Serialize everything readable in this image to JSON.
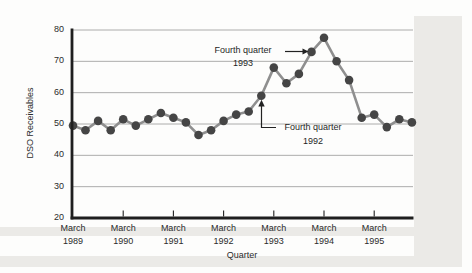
{
  "figure": {
    "y_axis_title": "DSO Receivables",
    "x_axis_title": "Quarter",
    "y_tick_labels": [
      "80",
      "70",
      "60",
      "50",
      "40",
      "30",
      "20"
    ],
    "x_ticks": [
      {
        "month": "March",
        "year": "1989"
      },
      {
        "month": "March",
        "year": "1990"
      },
      {
        "month": "March",
        "year": "1991"
      },
      {
        "month": "March",
        "year": "1992"
      },
      {
        "month": "March",
        "year": "1993"
      },
      {
        "month": "March",
        "year": "1994"
      },
      {
        "month": "March",
        "year": "1995"
      }
    ],
    "annotations": {
      "fq1993": {
        "line1": "Fourth quarter",
        "line2": "1993"
      },
      "fq1992": {
        "line1": "Fourth quarter",
        "line2": "1992"
      }
    }
  },
  "chart_data": {
    "type": "line",
    "title": "",
    "xlabel": "Quarter",
    "ylabel": "DSO Receivables",
    "ylim": [
      20,
      80
    ],
    "y_ticks": [
      20,
      30,
      40,
      50,
      60,
      70,
      80
    ],
    "grid": "horizontal",
    "legend": "none",
    "marker": "filled-circle",
    "x_tick_labels": [
      "March 1989",
      "March 1990",
      "March 1991",
      "March 1992",
      "March 1993",
      "March 1994",
      "March 1995"
    ],
    "x": [
      "Mar 1989",
      "Jun 1989",
      "Sep 1989",
      "Dec 1989",
      "Mar 1990",
      "Jun 1990",
      "Sep 1990",
      "Dec 1990",
      "Mar 1991",
      "Jun 1991",
      "Sep 1991",
      "Dec 1991",
      "Mar 1992",
      "Jun 1992",
      "Sep 1992",
      "Dec 1992",
      "Mar 1993",
      "Jun 1993",
      "Sep 1993",
      "Dec 1993",
      "Mar 1994",
      "Jun 1994",
      "Sep 1994",
      "Dec 1994",
      "Mar 1995",
      "Jun 1995",
      "Sep 1995",
      "Dec 1995"
    ],
    "values": [
      49.5,
      48,
      51,
      48,
      51.5,
      49.5,
      51.5,
      53.5,
      52,
      50.5,
      46.5,
      48,
      51,
      53,
      54,
      59,
      68,
      63,
      66,
      73,
      77.5,
      70,
      64,
      52,
      53,
      49,
      51.5,
      50.5
    ],
    "annotations": [
      {
        "text": "Fourth quarter 1993",
        "target_x": "Dec 1993",
        "target_value": 73,
        "arrow": "points right at data point"
      },
      {
        "text": "Fourth quarter 1992",
        "target_x": "Dec 1992",
        "target_value": 59,
        "arrow": "points up at data point"
      }
    ]
  },
  "colors": {
    "line": "#8f8f8f",
    "marker": "#454545",
    "axis": "#1f1f1f",
    "grid": "#a3a3a3",
    "text": "#2b2b2b",
    "scan_band": "#ebeae7"
  }
}
